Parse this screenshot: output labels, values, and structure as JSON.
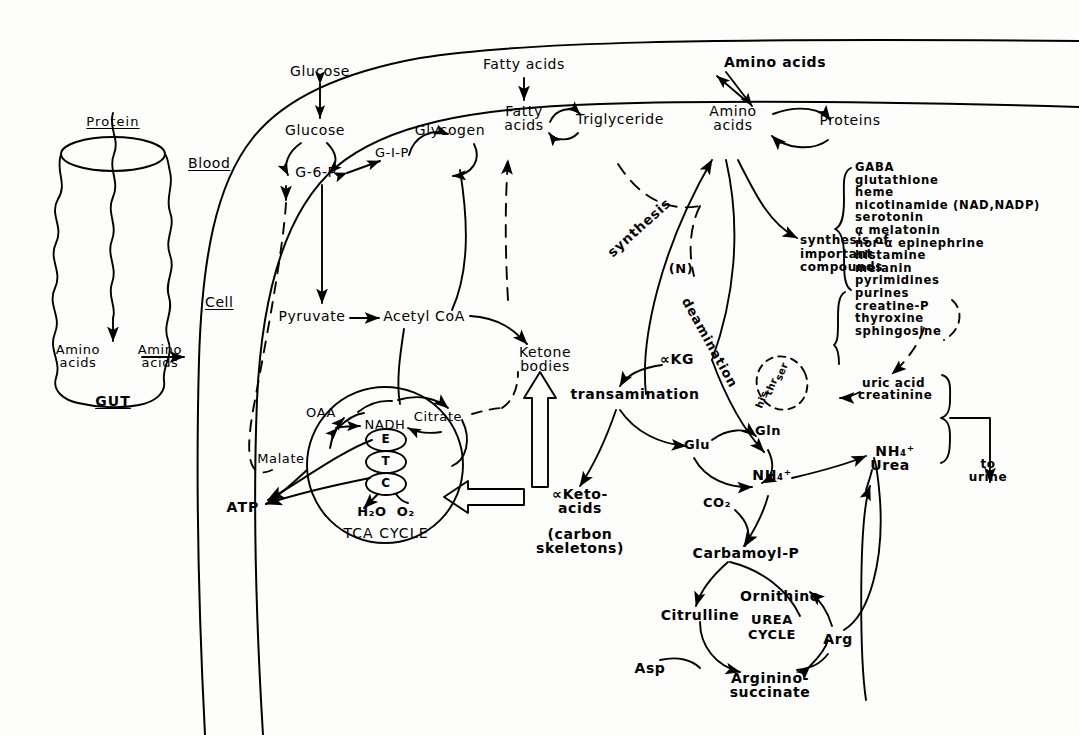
{
  "figure": {
    "compartments": {
      "gut_label": "GUT",
      "blood_label": "Blood",
      "cell_label": "Cell"
    }
  },
  "gut": {
    "protein": "Protein",
    "amino_acids_lumen": "Amino\nacids",
    "amino_acids_blood": "Amino\nacids"
  },
  "carbohydrate": {
    "glucose_blood": "Glucose",
    "glucose_cell": "Glucose",
    "g6p": "G-6-P",
    "g1p": "G-I-P",
    "glycogen": "Glycogen",
    "pyruvate": "Pyruvate",
    "acetyl_coa": "Acetyl CoA"
  },
  "lipid": {
    "fatty_acids_blood": "Fatty acids",
    "fatty_acids_cell": "Fatty\nacids",
    "triglyceride": "Triglyceride",
    "ketone_bodies": "Ketone\nbodies"
  },
  "protein_metab": {
    "amino_acids_blood": "Amino acids",
    "amino_acids_cell": "Amino\nacids",
    "proteins": "Proteins",
    "synthesis": "synthesis",
    "nitrogen_marker": "(N)",
    "deamination": "deamination",
    "transamination": "transamination",
    "akg": "∝KG",
    "synthesis_of_important_compounds": "synthesis of\nimportant\ncompounds",
    "deaminated_residues": [
      "ser",
      "thr",
      "his"
    ]
  },
  "important_compounds": [
    "GABA",
    "glutathione",
    "heme",
    "nicotinamide (NAD,NADP)",
    "serotonin",
    "α melatonin",
    "nor-α epinephrine",
    "histamine",
    "melanin",
    "pyrimidines",
    "purines",
    "creatine-P",
    "thyroxine",
    "sphingosine"
  ],
  "tca": {
    "cycle_label": "TCA CYCLE",
    "oaa": "OAA",
    "malate": "Malate",
    "nadh": "NADH",
    "citrate": "Citrate",
    "etc_chain": [
      "E",
      "T",
      "C"
    ],
    "products": "H₂O  O₂",
    "atp": "ATP",
    "keto_acids": "∝Keto-\nacids",
    "carbon_skeletons": "(carbon\nskeletons)"
  },
  "nitrogen_disposal": {
    "glu": "Glu",
    "gln": "Gln",
    "ammonium_left": "NH₄⁺",
    "ammonium_right": "NH₄⁺",
    "co2": "CO₂",
    "carbamoyl_p": "Carbamoyl-P",
    "urea": "Urea",
    "uric_acid": "uric acid",
    "creatinine": "creatinine",
    "to_urine": "to\nurine"
  },
  "urea_cycle": {
    "title": "UREA\nCYCLE",
    "citrulline": "Citrulline",
    "ornithine": "Ornithine",
    "arg": "Arg",
    "asp": "Asp",
    "argininosuccinate": "Arginino-\nsuccinate"
  },
  "colors": {
    "ink": "#000000",
    "paper": "#fdfdfb"
  }
}
